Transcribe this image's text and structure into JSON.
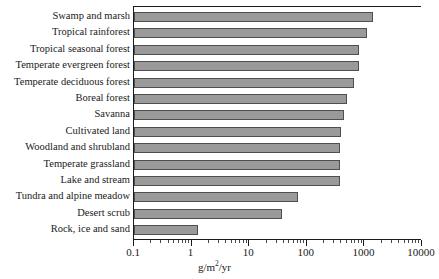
{
  "chart_data": {
    "type": "bar",
    "orientation": "horizontal",
    "title": "",
    "xlabel": "g/m2/yr",
    "xlabel_parts": {
      "before": "g/m",
      "sup": "2",
      "after": "/yr"
    },
    "ylabel": "",
    "xscale": "log",
    "xlim": [
      0.1,
      10000
    ],
    "grid": false,
    "legend": false,
    "xticks": [
      0.1,
      1,
      10,
      100,
      1000,
      10000
    ],
    "xtick_labels": [
      "0.1",
      "1",
      "10",
      "100",
      "1000",
      "10000"
    ],
    "categories": [
      "Swamp and marsh",
      "Tropical rainforest",
      "Tropical seasonal forest",
      "Temperate evergreen forest",
      "Temperate deciduous forest",
      "Boreal forest",
      "Savanna",
      "Cultivated land",
      "Woodland and shrubland",
      "Temperate grassland",
      "Lake and stream",
      "Tundra and alpine meadow",
      "Desert scrub",
      "Rock, ice and sand"
    ],
    "values": [
      1400,
      1100,
      800,
      800,
      650,
      500,
      450,
      400,
      380,
      380,
      380,
      70,
      37,
      1.3
    ],
    "bar_color": "#9a9a9a",
    "bar_edge_color": "#4f4f4f"
  }
}
